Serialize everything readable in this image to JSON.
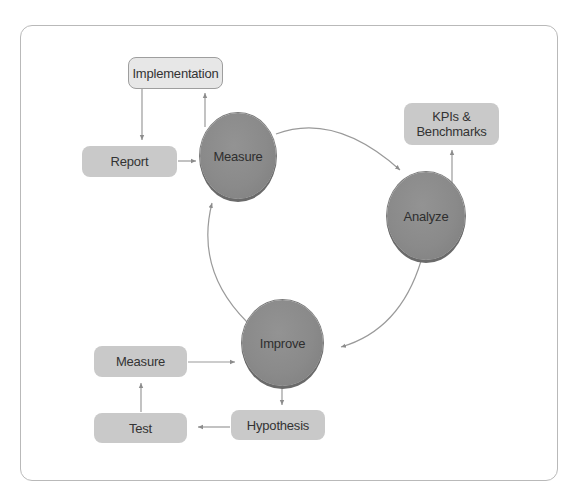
{
  "diagram": {
    "type": "cycle",
    "colors": {
      "circle_fill": "#8a8a8a",
      "box_fill": "#c9c9c9",
      "box_light_fill": "#e7e7e7",
      "arrow": "#8c8c8c",
      "frame_border": "#b9b9b9"
    },
    "circles": {
      "measure": "Measure",
      "analyze": "Analyze",
      "improve": "Improve"
    },
    "boxes": {
      "implementation": "Implementation",
      "report": "Report",
      "kpis": "KPIs & Benchmarks",
      "measure": "Measure",
      "test": "Test",
      "hypothesis": "Hypothesis"
    },
    "edges": [
      {
        "from": "Measure",
        "to": "Analyze"
      },
      {
        "from": "Analyze",
        "to": "Improve"
      },
      {
        "from": "Improve",
        "to": "Measure"
      },
      {
        "from": "Measure",
        "to": "Implementation"
      },
      {
        "from": "Implementation",
        "to": "Report"
      },
      {
        "from": "Report",
        "to": "Measure"
      },
      {
        "from": "Analyze",
        "to": "KPIs & Benchmarks"
      },
      {
        "from": "Improve",
        "to": "Hypothesis"
      },
      {
        "from": "Hypothesis",
        "to": "Test"
      },
      {
        "from": "Test",
        "to": "Measure (box)"
      },
      {
        "from": "Measure (box)",
        "to": "Improve"
      }
    ]
  }
}
